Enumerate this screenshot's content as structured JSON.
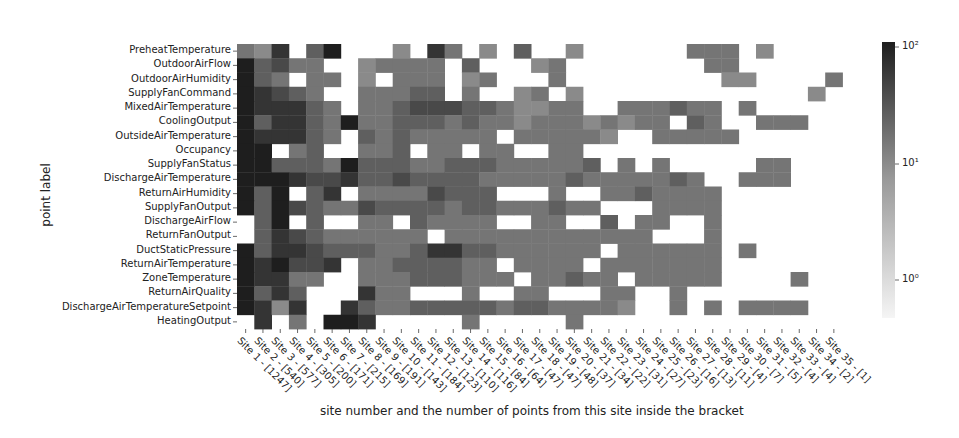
{
  "chart_data": {
    "type": "heatmap",
    "title": "",
    "xlabel": "site number and the number of points from this site inside the bracket",
    "ylabel": "point label",
    "scale": "log",
    "colormap": "greys",
    "colorbar": {
      "ticks": [
        "10^0",
        "10^1",
        "10^2"
      ],
      "tick_labels": [
        "10⁰",
        "10¹",
        "10²"
      ],
      "range": [
        0.5,
        120
      ]
    },
    "rows": [
      "PreheatTemperature",
      "OutdoorAirFlow",
      "OutdoorAirHumidity",
      "SupplyFanCommand",
      "MixedAirTemperature",
      "CoolingOutput",
      "OutsideAirTemperature",
      "Occupancy",
      "SupplyFanStatus",
      "DischargeAirTemperature",
      "ReturnAirHumidity",
      "SupplyFanOutput",
      "DischargeAirFlow",
      "ReturnFanOutput",
      "DuctStaticPressure",
      "ReturnAirTemperature",
      "ZoneTemperature",
      "ReturnAirQuality",
      "DischargeAirTemperatureSetpoint",
      "HeatingOutput"
    ],
    "columns": [
      "Site 1 - [1247]",
      "Site 2 - [540]",
      "Site 3 - [577]",
      "Site 4 - [305]",
      "Site 5 - [200]",
      "Site 6 - [171]",
      "Site 7 - [215]",
      "Site 8 - [169]",
      "Site 9 - [191]",
      "Site 10 - [143]",
      "Site 11 - [184]",
      "Site 12 - [123]",
      "Site 13 - [110]",
      "Site 14 - [116]",
      "Site 15 - [84]",
      "Site 16 - [64]",
      "Site 17 - [47]",
      "Site 18 - [47]",
      "Site 19 - [48]",
      "Site 20 - [37]",
      "Site 21 - [34]",
      "Site 22 - [22]",
      "Site 23 - [31]",
      "Site 24 - [27]",
      "Site 25 - [23]",
      "Site 26 - [16]",
      "Site 27 - [13]",
      "Site 28 - [11]",
      "Site 29 - [4]",
      "Site 30 - [7]",
      "Site 31 - [5]",
      "Site 32 - [4]",
      "Site 33 - [4]",
      "Site 34 - [2]",
      "Site 35 - [1]"
    ],
    "intensity_note": "0 = no points (white); 1-9 = relative log-count shade, light to dark",
    "matrix": [
      [
        5,
        4,
        8,
        0,
        6,
        9,
        0,
        0,
        0,
        4,
        0,
        8,
        5,
        0,
        4,
        0,
        6,
        0,
        0,
        4,
        0,
        0,
        0,
        0,
        0,
        0,
        5,
        5,
        5,
        0,
        4,
        0,
        0,
        0,
        0
      ],
      [
        9,
        6,
        7,
        5,
        5,
        0,
        0,
        4,
        5,
        5,
        5,
        5,
        0,
        6,
        0,
        0,
        0,
        4,
        5,
        0,
        0,
        0,
        0,
        0,
        0,
        0,
        0,
        5,
        5,
        0,
        0,
        0,
        0,
        0,
        0
      ],
      [
        9,
        6,
        5,
        0,
        5,
        5,
        0,
        4,
        0,
        5,
        5,
        5,
        0,
        4,
        5,
        0,
        0,
        0,
        5,
        0,
        0,
        0,
        0,
        0,
        0,
        0,
        0,
        0,
        4,
        4,
        0,
        0,
        0,
        0,
        5
      ],
      [
        9,
        8,
        7,
        6,
        5,
        0,
        0,
        5,
        5,
        5,
        6,
        6,
        0,
        5,
        0,
        0,
        4,
        5,
        0,
        4,
        0,
        0,
        0,
        0,
        0,
        0,
        0,
        0,
        0,
        0,
        0,
        0,
        0,
        4,
        0
      ],
      [
        9,
        8,
        8,
        8,
        6,
        5,
        0,
        5,
        5,
        6,
        7,
        7,
        7,
        6,
        6,
        5,
        4,
        4,
        5,
        5,
        0,
        0,
        5,
        5,
        5,
        6,
        5,
        5,
        0,
        5,
        0,
        0,
        0,
        0,
        0
      ],
      [
        9,
        6,
        8,
        8,
        6,
        5,
        9,
        5,
        5,
        6,
        6,
        6,
        5,
        6,
        5,
        5,
        4,
        5,
        5,
        5,
        4,
        5,
        4,
        5,
        5,
        0,
        6,
        5,
        0,
        0,
        5,
        5,
        5,
        0,
        0
      ],
      [
        9,
        8,
        8,
        8,
        6,
        5,
        0,
        6,
        5,
        6,
        5,
        5,
        5,
        5,
        5,
        0,
        5,
        5,
        5,
        5,
        5,
        4,
        0,
        0,
        5,
        5,
        5,
        5,
        5,
        0,
        0,
        0,
        0,
        0,
        0
      ],
      [
        9,
        9,
        0,
        5,
        6,
        0,
        0,
        5,
        5,
        6,
        0,
        5,
        5,
        0,
        5,
        5,
        0,
        0,
        5,
        5,
        0,
        0,
        0,
        0,
        0,
        0,
        0,
        0,
        0,
        0,
        0,
        0,
        0,
        0,
        0
      ],
      [
        9,
        9,
        6,
        6,
        6,
        5,
        9,
        6,
        6,
        6,
        5,
        5,
        6,
        6,
        6,
        5,
        5,
        5,
        5,
        5,
        6,
        0,
        5,
        0,
        5,
        0,
        0,
        0,
        0,
        0,
        5,
        5,
        0,
        0,
        0
      ],
      [
        9,
        9,
        9,
        8,
        7,
        7,
        8,
        6,
        6,
        7,
        6,
        6,
        6,
        6,
        5,
        5,
        5,
        5,
        5,
        6,
        5,
        5,
        5,
        5,
        5,
        6,
        5,
        0,
        0,
        5,
        5,
        5,
        0,
        0,
        0
      ],
      [
        9,
        6,
        9,
        0,
        6,
        8,
        0,
        5,
        5,
        5,
        5,
        7,
        6,
        6,
        6,
        0,
        0,
        0,
        5,
        0,
        0,
        5,
        5,
        6,
        5,
        5,
        5,
        5,
        0,
        0,
        0,
        0,
        0,
        0,
        0
      ],
      [
        9,
        6,
        9,
        7,
        6,
        5,
        5,
        7,
        6,
        6,
        6,
        6,
        5,
        6,
        6,
        5,
        5,
        5,
        6,
        5,
        5,
        0,
        0,
        0,
        5,
        5,
        5,
        5,
        0,
        0,
        0,
        0,
        0,
        0,
        0
      ],
      [
        0,
        6,
        9,
        0,
        6,
        0,
        0,
        5,
        5,
        0,
        6,
        5,
        5,
        5,
        5,
        0,
        0,
        5,
        5,
        0,
        0,
        6,
        0,
        5,
        5,
        0,
        0,
        5,
        0,
        0,
        0,
        0,
        0,
        0,
        0
      ],
      [
        0,
        6,
        8,
        7,
        6,
        5,
        5,
        5,
        5,
        5,
        5,
        0,
        5,
        5,
        5,
        5,
        5,
        5,
        5,
        5,
        5,
        5,
        5,
        5,
        0,
        0,
        0,
        5,
        0,
        0,
        0,
        0,
        0,
        0,
        0
      ],
      [
        9,
        6,
        8,
        8,
        7,
        6,
        6,
        6,
        5,
        5,
        6,
        8,
        8,
        6,
        6,
        5,
        5,
        5,
        5,
        5,
        5,
        0,
        5,
        5,
        5,
        5,
        5,
        5,
        0,
        5,
        0,
        0,
        0,
        0,
        0
      ],
      [
        9,
        8,
        9,
        7,
        7,
        8,
        0,
        5,
        5,
        6,
        6,
        6,
        6,
        5,
        5,
        0,
        5,
        5,
        5,
        5,
        0,
        5,
        5,
        5,
        5,
        5,
        5,
        5,
        0,
        0,
        0,
        0,
        0,
        0,
        0
      ],
      [
        9,
        8,
        8,
        5,
        5,
        0,
        0,
        5,
        5,
        5,
        6,
        6,
        6,
        5,
        5,
        5,
        0,
        5,
        5,
        6,
        5,
        5,
        0,
        5,
        5,
        5,
        5,
        5,
        0,
        0,
        0,
        0,
        5,
        0,
        0
      ],
      [
        9,
        6,
        8,
        6,
        0,
        0,
        0,
        8,
        5,
        5,
        0,
        0,
        0,
        5,
        0,
        0,
        5,
        5,
        0,
        0,
        0,
        5,
        5,
        0,
        0,
        5,
        0,
        0,
        0,
        0,
        0,
        0,
        0,
        0,
        0
      ],
      [
        9,
        8,
        4,
        8,
        0,
        0,
        8,
        6,
        5,
        5,
        6,
        6,
        6,
        6,
        6,
        5,
        6,
        6,
        5,
        5,
        5,
        5,
        4,
        0,
        0,
        5,
        0,
        5,
        0,
        5,
        5,
        5,
        5,
        0,
        0
      ],
      [
        0,
        8,
        0,
        5,
        0,
        9,
        9,
        8,
        0,
        0,
        0,
        0,
        0,
        5,
        0,
        0,
        0,
        0,
        0,
        5,
        0,
        0,
        0,
        0,
        0,
        0,
        0,
        0,
        0,
        0,
        0,
        0,
        0,
        0,
        0
      ]
    ]
  }
}
